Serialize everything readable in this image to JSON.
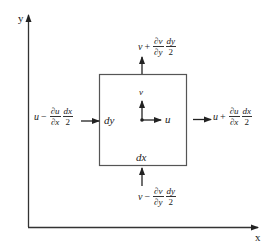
{
  "axes": {
    "x_label": "x",
    "y_label": "y"
  },
  "element": {
    "width_label": "dx",
    "height_label": "dy",
    "center_u": "u",
    "center_v": "v"
  },
  "fluxes": {
    "left": {
      "var": "u",
      "op": "−",
      "pd_num": "∂u",
      "pd_den": "∂x",
      "f_num": "dx",
      "f_den": "2"
    },
    "right": {
      "var": "u",
      "op": "+",
      "pd_num": "∂u",
      "pd_den": "∂x",
      "f_num": "dx",
      "f_den": "2"
    },
    "top": {
      "var": "v",
      "op": "+",
      "pd_num": "∂v",
      "pd_den": "∂y",
      "f_num": "dy",
      "f_den": "2"
    },
    "bottom": {
      "var": "v",
      "op": "−",
      "pd_num": "∂v",
      "pd_den": "∂y",
      "f_num": "dy",
      "f_den": "2"
    }
  },
  "colors": {
    "line": "#333333",
    "box": "#555555",
    "text": "#222222",
    "background": "#ffffff"
  }
}
